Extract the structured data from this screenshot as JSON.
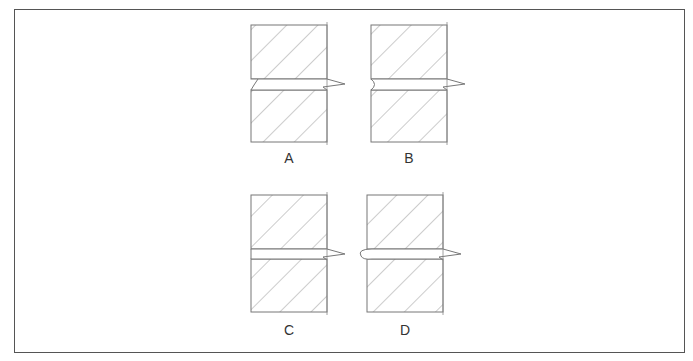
{
  "figure": {
    "panels": [
      {
        "id": "A",
        "label": "A",
        "joint_profile": "angled notch on left edge"
      },
      {
        "id": "B",
        "label": "B",
        "joint_profile": "concave rounded notch on left edge"
      },
      {
        "id": "C",
        "label": "C",
        "joint_profile": "flush straight left edge"
      },
      {
        "id": "D",
        "label": "D",
        "joint_profile": "convex rounded bead protruding on left edge"
      }
    ],
    "colors": {
      "line": "#777777",
      "hatch": "#9a9a9a",
      "frame": "#555555",
      "background": "#ffffff"
    }
  }
}
